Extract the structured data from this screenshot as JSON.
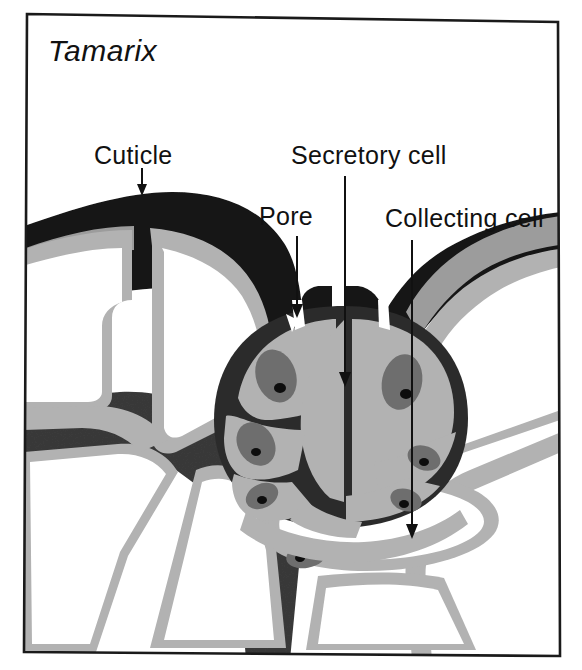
{
  "figure": {
    "title": "Tamarix",
    "kind": "botanical-diagram",
    "frame": {
      "border_color": "#1a1a1a",
      "background": "#ffffff"
    }
  },
  "labels": [
    {
      "id": "cuticle",
      "text": "Cuticle",
      "x": 94,
      "y": 143
    },
    {
      "id": "pore",
      "text": "Pore",
      "x": 259,
      "y": 204
    },
    {
      "id": "secretory-cell",
      "text": "Secretory cell",
      "x": 291,
      "y": 143
    },
    {
      "id": "collecting-cell",
      "text": "Collecting cell",
      "x": 385,
      "y": 206
    }
  ],
  "leader_lines": [
    {
      "id": "cuticle-arrow",
      "x1": 142,
      "y1": 168,
      "x2": 142,
      "y2": 194
    },
    {
      "id": "pore-arrow",
      "x1": 297,
      "y1": 236,
      "x2": 297,
      "y2": 316
    },
    {
      "id": "secretory-cell-arrow",
      "x1": 345,
      "y1": 176,
      "x2": 345,
      "y2": 385
    },
    {
      "id": "collecting-cell-arrow",
      "x1": 412,
      "y1": 240,
      "x2": 412,
      "y2": 537
    }
  ],
  "palette": {
    "ink": "#111111",
    "cuticle": "#141414",
    "wall_dark": "#3a3a3a",
    "cytoplasm": "#b2b2b2",
    "nucleus": "#6e6e6e",
    "nucleolus": "#0d0d0d",
    "vacuole": "#ffffff",
    "paper": "#ffffff"
  },
  "structures": {
    "cuticle_layer": "black outer cuticle arching over the epidermis",
    "gland_dome": "domed salt gland with eight secretory cells",
    "secretory_cells": 8,
    "pores": 2,
    "epidermal_cells": "large vacuolate cells with grey cytoplasm lining",
    "collecting_cell": "elongate cell beneath and right of the gland"
  }
}
